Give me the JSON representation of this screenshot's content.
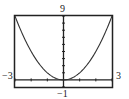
{
  "chart_data": {
    "type": "line",
    "title": "",
    "xlabel": "",
    "ylabel": "",
    "xlim": [
      -3,
      3
    ],
    "ylim": [
      -1,
      9
    ],
    "grid": false,
    "legend": null,
    "tick_labels": {
      "x_min": "−3",
      "x_max": "3",
      "y_max": "9",
      "y_min": "−1"
    },
    "x_ticks_step": 1,
    "y_ticks_step": 1,
    "series": [
      {
        "name": "y = x^2",
        "x": [
          -3,
          -2.5,
          -2,
          -1.5,
          -1,
          -0.5,
          0,
          0.5,
          1,
          1.5,
          2,
          2.5,
          3
        ],
        "y": [
          9,
          6.25,
          4,
          2.25,
          1,
          0.25,
          0,
          0.25,
          1,
          2.25,
          4,
          6.25,
          9
        ]
      }
    ]
  }
}
